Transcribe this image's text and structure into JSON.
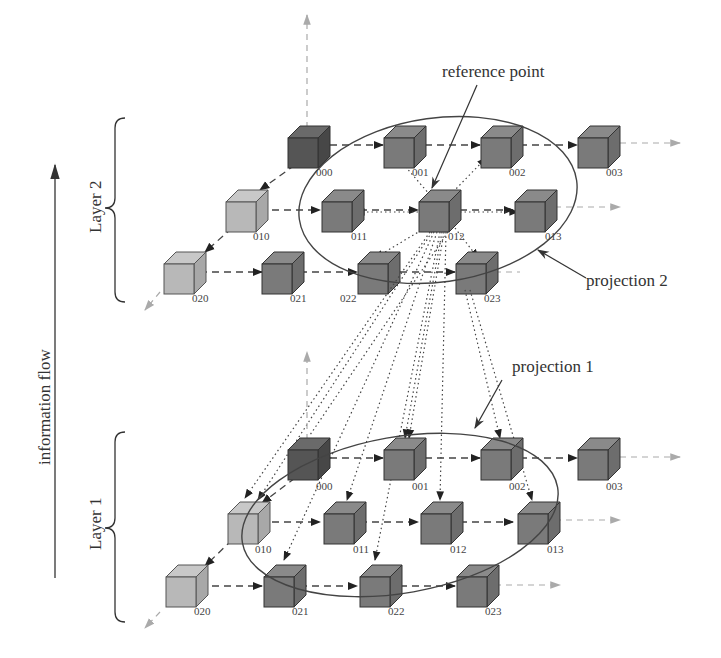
{
  "diagram": {
    "type": "layered-grid-projection",
    "labels": {
      "reference_point": "reference point",
      "projection_2": "projection 2",
      "projection_1": "projection 1",
      "layer_2": "Layer 2",
      "layer_1": "Layer 1",
      "information_flow": "information flow"
    },
    "colors": {
      "cube_dark": "#555555",
      "cube_mid": "#7a7a7a",
      "cube_light": "#b8b8b8",
      "axis_arrow": "#aaaaaa",
      "line": "#333333"
    },
    "layers": [
      {
        "name": "Layer 2",
        "nodes": [
          {
            "id": "000",
            "shade": "dark"
          },
          {
            "id": "001",
            "shade": "mid"
          },
          {
            "id": "002",
            "shade": "mid"
          },
          {
            "id": "003",
            "shade": "mid"
          },
          {
            "id": "010",
            "shade": "light"
          },
          {
            "id": "011",
            "shade": "mid"
          },
          {
            "id": "012",
            "shade": "mid",
            "role": "reference point"
          },
          {
            "id": "013",
            "shade": "mid"
          },
          {
            "id": "020",
            "shade": "light"
          },
          {
            "id": "021",
            "shade": "mid"
          },
          {
            "id": "022",
            "shade": "mid"
          },
          {
            "id": "023",
            "shade": "mid"
          }
        ],
        "projection": "projection 2"
      },
      {
        "name": "Layer 1",
        "nodes": [
          {
            "id": "000",
            "shade": "dark"
          },
          {
            "id": "001",
            "shade": "mid"
          },
          {
            "id": "002",
            "shade": "mid"
          },
          {
            "id": "003",
            "shade": "mid"
          },
          {
            "id": "010",
            "shade": "light"
          },
          {
            "id": "011",
            "shade": "mid"
          },
          {
            "id": "012",
            "shade": "mid"
          },
          {
            "id": "013",
            "shade": "mid"
          },
          {
            "id": "020",
            "shade": "light"
          },
          {
            "id": "021",
            "shade": "mid"
          },
          {
            "id": "022",
            "shade": "mid"
          },
          {
            "id": "023",
            "shade": "mid"
          }
        ],
        "projection": "projection 1"
      }
    ]
  }
}
